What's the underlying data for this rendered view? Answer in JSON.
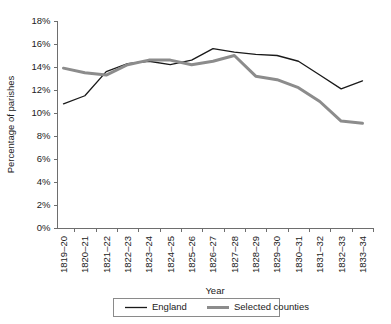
{
  "chart_data": {
    "type": "line",
    "title": "",
    "xlabel": "Year",
    "ylabel": "Percentage of parishes",
    "ylim": [
      0,
      18
    ],
    "ytick_labels": [
      "0%",
      "2%",
      "4%",
      "6%",
      "8%",
      "10%",
      "12%",
      "14%",
      "16%",
      "18%"
    ],
    "ytick_values": [
      0,
      2,
      4,
      6,
      8,
      10,
      12,
      14,
      16,
      18
    ],
    "grid": false,
    "legend_position": "bottom",
    "categories": [
      "1819–20",
      "1820–21",
      "1821–22",
      "1822–23",
      "1823–24",
      "1824–25",
      "1825–26",
      "1826–27",
      "1827–28",
      "1828–29",
      "1829–30",
      "1830–31",
      "1831–32",
      "1832–33",
      "1833–34"
    ],
    "series": [
      {
        "name": "England",
        "color": "#1a1a1a",
        "width": 1.3,
        "values": [
          10.8,
          11.5,
          13.6,
          14.3,
          14.5,
          14.2,
          14.6,
          15.6,
          15.3,
          15.1,
          15.0,
          14.5,
          13.3,
          12.1,
          12.8
        ]
      },
      {
        "name": "Selected counties",
        "color": "#8c8c8c",
        "width": 3.0,
        "values": [
          13.9,
          13.5,
          13.3,
          14.2,
          14.6,
          14.6,
          14.2,
          14.5,
          15.0,
          13.2,
          12.9,
          12.2,
          11.0,
          9.3,
          9.1
        ]
      }
    ]
  },
  "legend": {
    "entries": [
      {
        "label": "England"
      },
      {
        "label": "Selected counties"
      }
    ]
  }
}
